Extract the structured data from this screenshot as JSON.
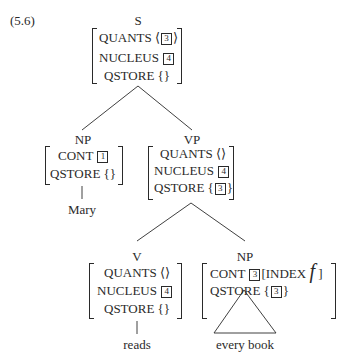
{
  "example_number": "(5.6)",
  "tree": {
    "root": {
      "category": "S",
      "features": [
        {
          "attr": "QUANTS",
          "open": "⟨",
          "tag": "3",
          "close": "⟩"
        },
        {
          "attr": "NUCLEUS",
          "tag": "4"
        },
        {
          "attr": "QSTORE",
          "open": "{",
          "close": "}"
        }
      ]
    },
    "np_subject": {
      "category": "NP",
      "features": [
        {
          "attr": "CONT",
          "tag": "1"
        },
        {
          "attr": "QSTORE",
          "open": "{",
          "close": "}"
        }
      ],
      "word": "Mary"
    },
    "vp": {
      "category": "VP",
      "features": [
        {
          "attr": "QUANTS",
          "open": "⟨",
          "close": "⟩"
        },
        {
          "attr": "NUCLEUS",
          "tag": "4"
        },
        {
          "attr": "QSTORE",
          "open": "{",
          "tag": "3",
          "close": "}"
        }
      ]
    },
    "verb": {
      "category": "V",
      "features": [
        {
          "attr": "QUANTS",
          "open": "⟨",
          "close": "⟩"
        },
        {
          "attr": "NUCLEUS",
          "tag": "4"
        },
        {
          "attr": "QSTORE",
          "open": "{",
          "close": "}"
        }
      ],
      "word": "reads"
    },
    "np_object": {
      "category": "NP",
      "features": [
        {
          "attr": "CONT",
          "tag": "3",
          "inner_open": "[",
          "inner_attr": "INDEX",
          "inner_value": "f",
          "inner_close": "]"
        },
        {
          "attr": "QSTORE",
          "open": "{",
          "tag": "3",
          "close": "}"
        }
      ],
      "words": "every book"
    }
  }
}
